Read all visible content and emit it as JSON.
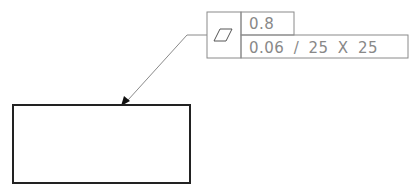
{
  "feature_control_frame": {
    "symbol": "flatness-icon",
    "tolerance_total": "0.8",
    "tolerance_unit_area": "0.06 / 25 X 25"
  },
  "colors": {
    "frame_line": "#8a8a8a",
    "leader_line": "#8a8a8a",
    "part_outline": "#222222",
    "text": "#888888"
  }
}
